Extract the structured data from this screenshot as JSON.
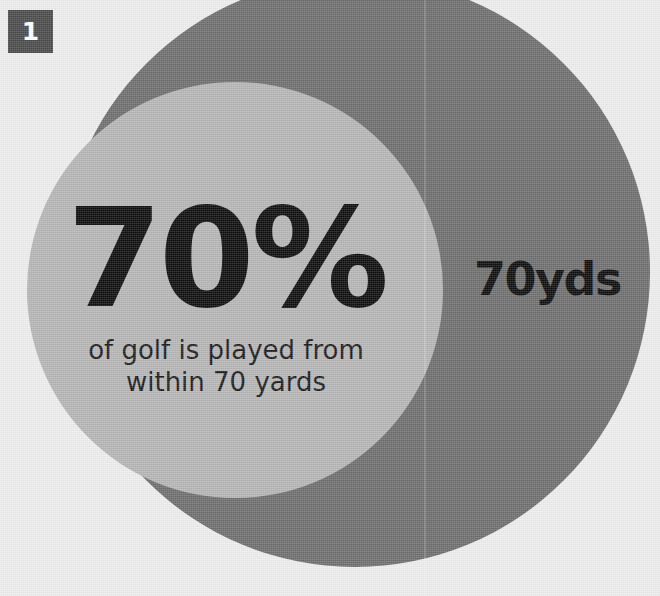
{
  "badge": {
    "number": "1"
  },
  "stat": {
    "value": "70%",
    "caption_line_1": "of golf is played from",
    "caption_line_2": "within 70 yards"
  },
  "ring": {
    "label": "70yds"
  },
  "colors": {
    "background": "#eeeeee",
    "outer_circle": "#6e6e6e",
    "inner_circle": "#b6b6b6",
    "text": "#0d0d0d",
    "badge_background": "#4a4a4a",
    "badge_text": "#ffffff"
  },
  "chart_data": {
    "type": "pie",
    "title": "70% of golf is played from within 70 yards",
    "categories": [
      "Played within 70 yards",
      "Played beyond 70 yards"
    ],
    "values": [
      70,
      30
    ],
    "units": "percent",
    "xlabel": "",
    "ylabel": "",
    "legend": "none",
    "grid": false,
    "annotations": [
      "70%",
      "of golf is played from",
      "within 70 yards",
      "70yds"
    ]
  }
}
